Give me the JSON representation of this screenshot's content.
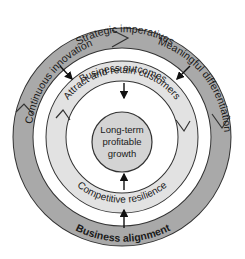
{
  "diagram": {
    "colors": {
      "outer_ring": "#a9a9a9",
      "middle_ring": "#e2e2e2",
      "center_circle": "#d4d4d4",
      "stroke": "#333333",
      "background": "#ffffff"
    },
    "outer_ring": {
      "top_label": "Strategic imperatives",
      "left_segment": "Continuous innovation",
      "right_segment": "Meaningful differentiation",
      "bottom_label": "Business alignment"
    },
    "middle_ring": {
      "top_label": "Business outcomes",
      "top_segment": "Attract and retain customers",
      "bottom_segment": "Competitive resilience"
    },
    "center": {
      "line1": "Long-term",
      "line2": "profitable",
      "line3": "growth"
    }
  }
}
